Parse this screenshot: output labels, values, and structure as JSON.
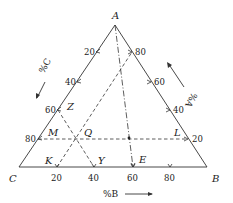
{
  "diagram": {
    "type": "ternary-phase-diagram",
    "vertices": {
      "A": {
        "label": "A",
        "x": 115,
        "y": 25
      },
      "B": {
        "label": "B",
        "x": 207,
        "y": 167
      },
      "C": {
        "label": "C",
        "x": 19,
        "y": 167
      }
    },
    "axes": {
      "left": {
        "label": "%C",
        "direction": "down-left",
        "ticks": [
          "20",
          "40",
          "60",
          "80"
        ]
      },
      "right": {
        "label": "%A",
        "direction": "up-left",
        "ticks": [
          "80",
          "60",
          "40",
          "20"
        ]
      },
      "bottom": {
        "label": "%B",
        "direction": "right",
        "ticks": [
          "20",
          "40",
          "60",
          "80"
        ]
      }
    },
    "points": {
      "M": "M",
      "L": "L",
      "Q": "Q",
      "Z": "Z",
      "K": "K",
      "Y": "Y",
      "E": "E"
    },
    "lines": [
      {
        "name": "M-L",
        "style": "dashed",
        "meaning": "constant 20% A"
      },
      {
        "name": "K-80%A side",
        "style": "dashed",
        "meaning": "constant 20%... parallel to AB? line from K"
      },
      {
        "name": "Z-Y",
        "style": "dashed",
        "meaning": "line from Z to Y"
      },
      {
        "name": "A-E",
        "style": "dash-dot",
        "meaning": "line from A to E"
      }
    ]
  }
}
